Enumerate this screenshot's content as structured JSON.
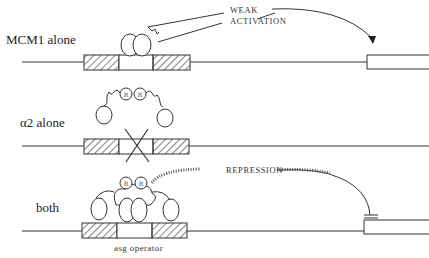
{
  "diagram": {
    "type": "gene regulation schematic",
    "rows": [
      {
        "id": "mcm1",
        "label": "MCM1 alone",
        "effect_label_line1": "WEAK",
        "effect_label_line2": "ACTIVATION",
        "operator_blocked": false
      },
      {
        "id": "alpha2",
        "label": "α2 alone",
        "operator_blocked": true
      },
      {
        "id": "both",
        "label": "both",
        "effect_label_line1": "REPRESSION",
        "operator_label": "asg operator",
        "operator_blocked": false
      }
    ],
    "protein_glyph": "R"
  }
}
